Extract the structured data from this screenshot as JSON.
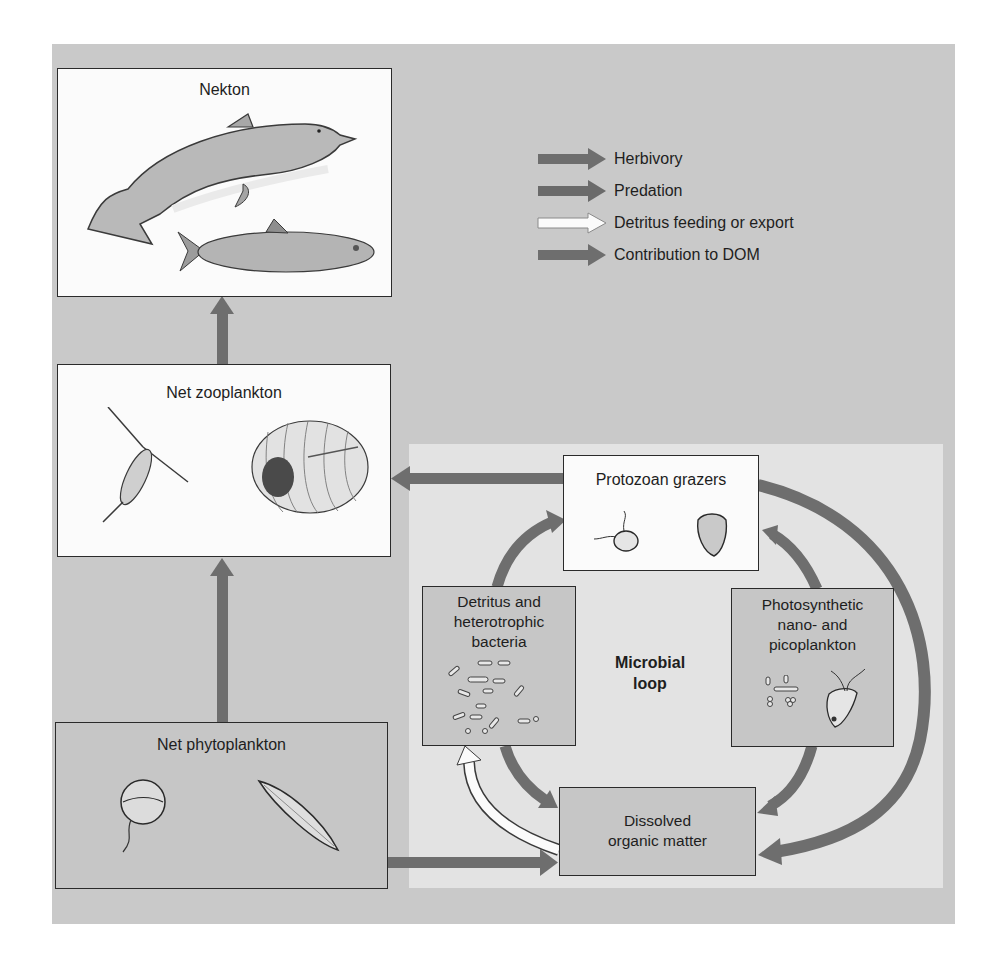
{
  "diagram": {
    "type": "marine food web with microbial loop",
    "colors": {
      "outer_panel": "#c9c9c9",
      "microbial_panel": "#e3e3e3",
      "arrow_dark": "#6e6e6e",
      "arrow_white": "#fbfbfb",
      "box_white": "#fbfbfb",
      "box_gray": "#c6c6c6"
    },
    "legend": [
      {
        "label": "Herbivory",
        "arrow_style": "dark"
      },
      {
        "label": "Predation",
        "arrow_style": "dark"
      },
      {
        "label": "Detritus feeding or export",
        "arrow_style": "white"
      },
      {
        "label": "Contribution to DOM",
        "arrow_style": "dark"
      }
    ],
    "nodes": {
      "nekton": {
        "label": "Nekton",
        "illustrations": [
          "dolphin",
          "fish"
        ]
      },
      "zooplankton": {
        "label": "Net zooplankton",
        "illustrations": [
          "copepod",
          "larval-organism"
        ]
      },
      "phytoplankton": {
        "label": "Net phytoplankton",
        "illustrations": [
          "dinoflagellate",
          "diatom"
        ]
      },
      "protozoan": {
        "label": "Protozoan grazers",
        "illustrations": [
          "flagellate",
          "ciliate"
        ]
      },
      "detritus": {
        "label_lines": [
          "Detritus and",
          "heterotrophic",
          "bacteria"
        ]
      },
      "photosynthetic": {
        "label_lines": [
          "Photosynthetic",
          "nano- and",
          "picoplankton"
        ]
      },
      "dom": {
        "label_lines": [
          "Dissolved",
          "organic matter"
        ]
      }
    },
    "microbial_loop_label_lines": [
      "Microbial",
      "loop"
    ],
    "edges": [
      {
        "from": "Net zooplankton",
        "to": "Nekton",
        "style": "dark"
      },
      {
        "from": "Net phytoplankton",
        "to": "Net zooplankton",
        "style": "dark"
      },
      {
        "from": "Protozoan grazers",
        "to": "Net zooplankton",
        "style": "dark"
      },
      {
        "from": "Detritus and heterotrophic bacteria",
        "to": "Protozoan grazers",
        "style": "dark"
      },
      {
        "from": "Photosynthetic nano- and picoplankton",
        "to": "Protozoan grazers",
        "style": "dark"
      },
      {
        "from": "Detritus and heterotrophic bacteria",
        "to": "Dissolved organic matter",
        "style": "dark"
      },
      {
        "from": "Photosynthetic nano- and picoplankton",
        "to": "Dissolved organic matter",
        "style": "dark"
      },
      {
        "from": "Protozoan grazers",
        "to": "Dissolved organic matter",
        "style": "dark"
      },
      {
        "from": "Net phytoplankton",
        "to": "Dissolved organic matter",
        "style": "dark"
      },
      {
        "from": "Dissolved organic matter",
        "to": "Detritus and heterotrophic bacteria",
        "style": "white"
      }
    ]
  }
}
